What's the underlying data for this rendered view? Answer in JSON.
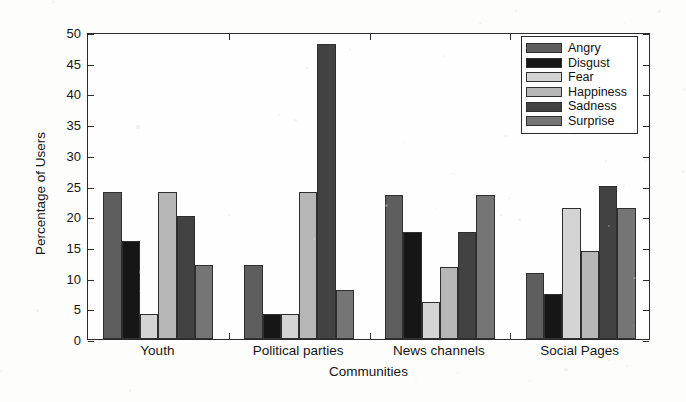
{
  "chart_data": {
    "type": "bar",
    "title": "",
    "xlabel": "Communities",
    "ylabel": "Percentage of Users",
    "categories": [
      "Youth",
      "Political parties",
      "News channels",
      "Social Pages"
    ],
    "ylim": [
      0,
      50
    ],
    "yticks": [
      0,
      5,
      10,
      15,
      20,
      25,
      30,
      35,
      40,
      45,
      50
    ],
    "grid": false,
    "legend_position": "top-right",
    "series": [
      {
        "name": "Angry",
        "color": "#5e5e5e",
        "values": [
          24.0,
          12.0,
          23.5,
          10.7
        ]
      },
      {
        "name": "Disgust",
        "color": "#161616",
        "values": [
          16.0,
          4.0,
          17.5,
          7.3
        ]
      },
      {
        "name": "Fear",
        "color": "#d4d4d4",
        "values": [
          4.0,
          4.0,
          6.0,
          21.4
        ]
      },
      {
        "name": "Happiness",
        "color": "#b7b7b7",
        "values": [
          24.0,
          24.0,
          11.8,
          14.3
        ]
      },
      {
        "name": "Sadness",
        "color": "#424242",
        "values": [
          20.0,
          48.0,
          17.5,
          25.0
        ]
      },
      {
        "name": "Surprise",
        "color": "#757575",
        "values": [
          12.0,
          8.0,
          23.5,
          21.4
        ]
      }
    ]
  },
  "axis": {
    "y_title": "Percentage of Users",
    "x_title": "Communities"
  },
  "legend": {
    "entries": [
      {
        "label": "Angry"
      },
      {
        "label": "Disgust"
      },
      {
        "label": "Fear"
      },
      {
        "label": "Happiness"
      },
      {
        "label": "Sadness"
      },
      {
        "label": "Surprise"
      }
    ]
  }
}
